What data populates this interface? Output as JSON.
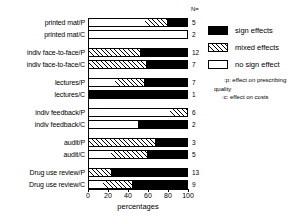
{
  "chart_data": {
    "type": "bar",
    "orientation": "horizontal",
    "stacked": true,
    "title": "",
    "xlabel": "percentages",
    "ylabel": "",
    "xlim": [
      0,
      100
    ],
    "xticks": [
      0,
      20,
      40,
      60,
      80,
      100
    ],
    "grid": false,
    "legend_position": "right",
    "n_header": "N=",
    "series": [
      {
        "name": "no sign effect",
        "color": "#ffffff",
        "pattern": "solid-white"
      },
      {
        "name": "mixed effects",
        "color": "#ffffff",
        "pattern": "diagonal-hatch"
      },
      {
        "name": "sign effects",
        "color": "#000000",
        "pattern": "solid-black"
      }
    ],
    "categories": [
      "printed mat/P",
      "printed mat/C",
      "indiv face-to-face/P",
      "indiv face-to-face/C",
      "lectures/P",
      "lectures/C",
      "indiv feedback/P",
      "indiv feedback/C",
      "audit/P",
      "audit/C",
      "Drug use review/P",
      "Drug use review/C"
    ],
    "rows": [
      {
        "label": "printed mat/P",
        "n": "5",
        "group": 0,
        "no_sign_effect": 57,
        "mixed_effects": 23,
        "sign_effects": 20
      },
      {
        "label": "printed mat/C",
        "n": "2",
        "group": 0,
        "no_sign_effect": 100,
        "mixed_effects": 0,
        "sign_effects": 0
      },
      {
        "label": "indiv face-to-face/P",
        "n": "12",
        "group": 1,
        "no_sign_effect": 0,
        "mixed_effects": 52,
        "sign_effects": 48
      },
      {
        "label": "indiv face-to-face/C",
        "n": "7",
        "group": 1,
        "no_sign_effect": 0,
        "mixed_effects": 58,
        "sign_effects": 42
      },
      {
        "label": "lectures/P",
        "n": "7",
        "group": 2,
        "no_sign_effect": 27,
        "mixed_effects": 29,
        "sign_effects": 44
      },
      {
        "label": "lectures/C",
        "n": "1",
        "group": 2,
        "no_sign_effect": 0,
        "mixed_effects": 0,
        "sign_effects": 100
      },
      {
        "label": "indiv feedback/P",
        "n": "6",
        "group": 3,
        "no_sign_effect": 83,
        "mixed_effects": 17,
        "sign_effects": 0
      },
      {
        "label": "indiv feedback/C",
        "n": "2",
        "group": 3,
        "no_sign_effect": 50,
        "mixed_effects": 0,
        "sign_effects": 50
      },
      {
        "label": "audit/P",
        "n": "3",
        "group": 4,
        "no_sign_effect": 0,
        "mixed_effects": 67,
        "sign_effects": 33
      },
      {
        "label": "audit/C",
        "n": "5",
        "group": 4,
        "no_sign_effect": 22,
        "mixed_effects": 37,
        "sign_effects": 41
      },
      {
        "label": "Drug use review/P",
        "n": "13",
        "group": 5,
        "no_sign_effect": 0,
        "mixed_effects": 22,
        "sign_effects": 78
      },
      {
        "label": "Drug use review/C",
        "n": "9",
        "group": 5,
        "no_sign_effect": 14,
        "mixed_effects": 30,
        "sign_effects": 56
      }
    ]
  },
  "legend": {
    "items": [
      {
        "label": "sign effects",
        "swatch": "sw-sign"
      },
      {
        "label": "mixed effects",
        "swatch": "sw-mixed"
      },
      {
        "label": "no sign effect",
        "swatch": "sw-none"
      }
    ]
  },
  "footnotes": {
    "line1": ":p: effect on prescribing",
    "line2": "quality",
    "line3": ":c: effect on costs"
  }
}
